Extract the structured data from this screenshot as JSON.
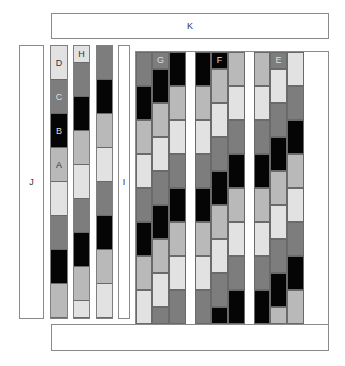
{
  "palette": {
    "L": "#e2e2e2",
    "M": "#b9b9b9",
    "D": "#7d7d7d",
    "K": "#050505"
  },
  "labels": {
    "top_bar": "K",
    "left_frame": "J",
    "narrow_frame": "I",
    "col_d_labels": [
      "D",
      "C",
      "B",
      "A"
    ],
    "col_h_label": "H",
    "group_g": "G",
    "group_f": "F",
    "group_e": "E"
  },
  "columns": {
    "col1": [
      "L",
      "D",
      "K",
      "M",
      "L",
      "D",
      "K",
      "M"
    ],
    "col2": [
      "L",
      "D",
      "K",
      "M",
      "L",
      "D",
      "K",
      "M",
      "L"
    ],
    "col3": [
      "D",
      "K",
      "M",
      "L",
      "D",
      "K",
      "M",
      "L"
    ]
  },
  "grid_groups": {
    "G": [
      [
        "D",
        "K",
        "M",
        "L",
        "D",
        "K",
        "M",
        "L"
      ],
      [
        "D",
        "K",
        "M",
        "L",
        "D",
        "K",
        "M",
        "L",
        "D"
      ],
      [
        "K",
        "M",
        "L",
        "D",
        "K",
        "M",
        "L",
        "D"
      ]
    ],
    "F": [
      [
        "K",
        "M",
        "L",
        "D",
        "K",
        "M",
        "L",
        "D"
      ],
      [
        "K",
        "M",
        "L",
        "D",
        "K",
        "M",
        "L",
        "D",
        "K"
      ],
      [
        "M",
        "L",
        "D",
        "K",
        "M",
        "L",
        "D",
        "K"
      ]
    ],
    "E": [
      [
        "M",
        "L",
        "D",
        "K",
        "M",
        "L",
        "D",
        "K"
      ],
      [
        "D",
        "L",
        "D",
        "K",
        "M",
        "L",
        "D",
        "K",
        "M"
      ],
      [
        "L",
        "D",
        "K",
        "M",
        "L",
        "D",
        "K",
        "M"
      ]
    ]
  }
}
